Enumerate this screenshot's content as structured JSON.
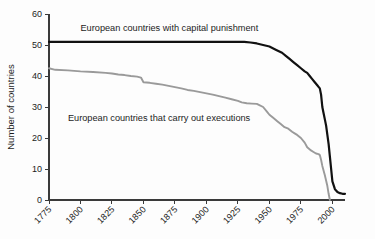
{
  "chart_data": {
    "type": "line",
    "title": "",
    "subtitle": "",
    "xlabel": "",
    "ylabel": "Number of countries",
    "xlim": [
      1775,
      2010
    ],
    "ylim": [
      0,
      60
    ],
    "grid": false,
    "legend_position": "inline-annotation",
    "x_ticks": [
      1775,
      1800,
      1825,
      1850,
      1875,
      1900,
      1925,
      1950,
      1975,
      2000
    ],
    "x_tick_labels": [
      "1775",
      "1800",
      "1825",
      "1850",
      "1875",
      "1900",
      "1925",
      "1950",
      "1975",
      "2000"
    ],
    "x_tick_rotation": 45,
    "y_ticks": [
      0,
      10,
      20,
      30,
      40,
      50,
      60
    ],
    "y_tick_labels": [
      "0",
      "10",
      "20",
      "30",
      "40",
      "50",
      "60"
    ],
    "series": [
      {
        "name": "European countries with capital punishment",
        "color": "#111111",
        "width": 2.2,
        "label_x": 1800,
        "label_y": 54.5,
        "x": [
          1775,
          1800,
          1825,
          1850,
          1875,
          1900,
          1910,
          1920,
          1925,
          1930,
          1935,
          1940,
          1945,
          1950,
          1955,
          1960,
          1963,
          1966,
          1969,
          1972,
          1975,
          1978,
          1980,
          1982,
          1984,
          1986,
          1988,
          1989,
          1990,
          1991,
          1992,
          1993,
          1994,
          1995,
          1996,
          1997,
          1998,
          1999,
          2000,
          2002,
          2004,
          2006,
          2008,
          2010
        ],
        "y": [
          51,
          51,
          51,
          51,
          51,
          51,
          51,
          51,
          51,
          51,
          50.8,
          50.5,
          50,
          49.5,
          48.5,
          47.5,
          46.5,
          45.5,
          44.5,
          43.5,
          42.5,
          41.5,
          41,
          40,
          39,
          38,
          37,
          36.5,
          36,
          34,
          30,
          28,
          26,
          24,
          21,
          18,
          14,
          10,
          6,
          3.5,
          2.6,
          2.2,
          2,
          2
        ]
      },
      {
        "name": "European countries that carry out executions",
        "color": "#9a9a9a",
        "width": 1.9,
        "label_x": 1790,
        "label_y": 25.5,
        "x": [
          1775,
          1780,
          1790,
          1800,
          1810,
          1820,
          1825,
          1830,
          1835,
          1840,
          1845,
          1848,
          1850,
          1855,
          1860,
          1865,
          1870,
          1875,
          1880,
          1885,
          1890,
          1895,
          1900,
          1905,
          1910,
          1915,
          1920,
          1925,
          1928,
          1932,
          1936,
          1940,
          1942,
          1945,
          1948,
          1950,
          1953,
          1956,
          1959,
          1962,
          1965,
          1968,
          1970,
          1972,
          1975,
          1978,
          1980,
          1983,
          1985,
          1987,
          1989,
          1990,
          1991,
          1992,
          1994,
          1996,
          1997,
          1998
        ],
        "y": [
          42.5,
          42,
          41.8,
          41.5,
          41.3,
          41,
          40.8,
          40.5,
          40.3,
          40,
          39.8,
          39.5,
          38,
          37.8,
          37.5,
          37.2,
          36.8,
          36.4,
          36,
          35.5,
          35.2,
          34.8,
          34.4,
          34,
          33.5,
          33,
          32.5,
          32,
          31.5,
          31.2,
          31.1,
          31,
          30.6,
          30,
          28.5,
          27.5,
          26.5,
          25.5,
          24.5,
          23.5,
          23,
          22,
          21.5,
          21,
          20,
          18.5,
          17,
          16,
          15.5,
          15,
          14.8,
          14.5,
          13,
          11,
          8,
          4.5,
          2,
          0
        ]
      }
    ]
  }
}
